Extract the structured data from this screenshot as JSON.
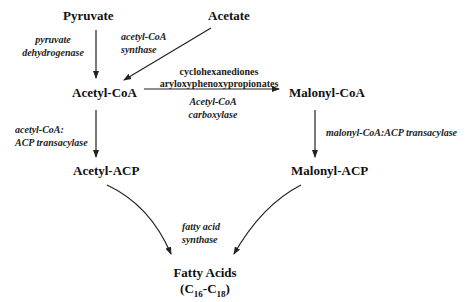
{
  "diagram": {
    "type": "biochemical-pathway",
    "nodes": {
      "pyruvate": "Pyruvate",
      "acetate": "Acetate",
      "acetyl_coa": "Acetyl-CoA",
      "malonyl_coa": "Malonyl-CoA",
      "acetyl_acp": "Acetyl-ACP",
      "malonyl_acp": "Malonyl-ACP",
      "fatty_acids": "Fatty Acids",
      "fatty_acids_range_open": "(C",
      "fatty_acids_sub1": "16",
      "fatty_acids_dash": "-C",
      "fatty_acids_sub2": "18",
      "fatty_acids_range_close": ")"
    },
    "enzymes": {
      "pdh_line1": "pyruvate",
      "pdh_line2": "dehydrogenase",
      "acs_line1": "acetyl-CoA",
      "acs_line2": "synthase",
      "acc_line1": "Acetyl-CoA",
      "acc_line2": "carboxylase",
      "acat_line1": "acetyl-CoA:",
      "acat_line2": "ACP transacylase",
      "mcat": "malonyl-CoA:ACP transacylase",
      "fas_line1": "fatty acid",
      "fas_line2": "synthase"
    },
    "inhibitors": {
      "line1": "cyclohexanediones",
      "line2": "aryloxyphenoxypropionates"
    },
    "edges": [
      {
        "from": "Pyruvate",
        "to": "Acetyl-CoA",
        "enzyme": "pyruvate dehydrogenase"
      },
      {
        "from": "Acetate",
        "to": "Acetyl-CoA",
        "enzyme": "acetyl-CoA synthase"
      },
      {
        "from": "Acetyl-CoA",
        "to": "Malonyl-CoA",
        "enzyme": "Acetyl-CoA carboxylase",
        "inhibited_by": [
          "cyclohexanediones",
          "aryloxyphenoxypropionates"
        ]
      },
      {
        "from": "Acetyl-CoA",
        "to": "Acetyl-ACP",
        "enzyme": "acetyl-CoA:ACP transacylase"
      },
      {
        "from": "Malonyl-CoA",
        "to": "Malonyl-ACP",
        "enzyme": "malonyl-CoA:ACP transacylase"
      },
      {
        "from": "Acetyl-ACP",
        "to": "Fatty Acids",
        "enzyme": "fatty acid synthase"
      },
      {
        "from": "Malonyl-ACP",
        "to": "Fatty Acids",
        "enzyme": "fatty acid synthase"
      }
    ],
    "colors": {
      "line": "#222222",
      "text": "#111111",
      "background": "#ffffff"
    }
  }
}
